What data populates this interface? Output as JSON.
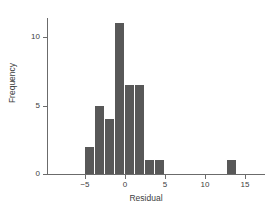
{
  "chart_data": {
    "type": "bar",
    "title": "",
    "subtitle": "",
    "xlabel": "Residual",
    "ylabel": "Frequency",
    "xlim": [
      -8,
      16
    ],
    "ylim": [
      0,
      11.6
    ],
    "grid": false,
    "legend": null,
    "bin_width": 1.25,
    "xticks": [
      -5,
      0,
      5,
      10,
      15
    ],
    "xtick_labels": [
      "−5",
      "0",
      "5",
      "10",
      "15"
    ],
    "yticks": [
      0,
      5,
      10
    ],
    "ytick_labels": [
      "0",
      "5",
      "10"
    ],
    "bar_color": "#585858",
    "axis_color": "#6b6b6b",
    "text_color": "#404040",
    "background": "#ffffff",
    "bins": [
      {
        "left": -5.0,
        "right": -3.75,
        "value": 2
      },
      {
        "left": -3.75,
        "right": -2.5,
        "value": 5
      },
      {
        "left": -2.5,
        "right": -1.25,
        "value": 4
      },
      {
        "left": -1.25,
        "right": 0.0,
        "value": 11
      },
      {
        "left": 0.0,
        "right": 1.25,
        "value": 6.5
      },
      {
        "left": 1.25,
        "right": 2.5,
        "value": 6.5
      },
      {
        "left": 2.5,
        "right": 3.75,
        "value": 1
      },
      {
        "left": 3.75,
        "right": 5.0,
        "value": 1
      },
      {
        "left": 12.75,
        "right": 14.0,
        "value": 1
      }
    ],
    "categories": [
      "-5",
      "-3.75",
      "-2.5",
      "-1.25",
      "0",
      "1.25",
      "2.5",
      "3.75",
      "12.75"
    ],
    "values": [
      2,
      5,
      4,
      11,
      6.5,
      6.5,
      1,
      1,
      1
    ]
  }
}
